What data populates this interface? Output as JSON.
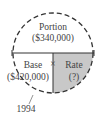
{
  "diagram": {
    "sections": {
      "top": {
        "label": "Portion",
        "value": "($340,000)"
      },
      "bottom_left": {
        "label": "Base",
        "value": "($420,000)"
      },
      "bottom_right": {
        "label": "Rate",
        "value": "(?)"
      }
    },
    "operator": "×",
    "annotation": "1994",
    "colors": {
      "shaded": "#c8c8c8",
      "line": "#333333"
    }
  }
}
